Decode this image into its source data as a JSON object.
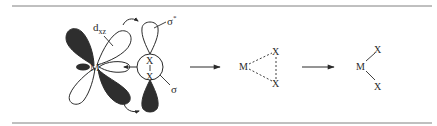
{
  "diagram": {
    "type": "oxidative-addition-mechanism",
    "colors": {
      "rule": "#808080",
      "ink": "#2a2a2a",
      "filled_lobe": "#2e2e2e",
      "background": "#ffffff"
    },
    "stage1": {
      "metal_label": "M",
      "orbital_label": "d",
      "orbital_subscript": "xz",
      "sigma_star_label": "σ",
      "sigma_star_superscript": "*",
      "sigma_label": "σ",
      "x_top": "X",
      "x_bottom": "X",
      "bond": "|"
    },
    "stage2": {
      "metal_label": "M",
      "x_top": "X",
      "x_bottom": "X",
      "bond_style": "dashed"
    },
    "stage3": {
      "metal_label": "M",
      "x_top": "X",
      "x_bottom": "X",
      "bond_style": "solid"
    },
    "arrows": [
      {
        "from": "stage1",
        "to": "stage2"
      },
      {
        "from": "stage2",
        "to": "stage3"
      }
    ]
  }
}
